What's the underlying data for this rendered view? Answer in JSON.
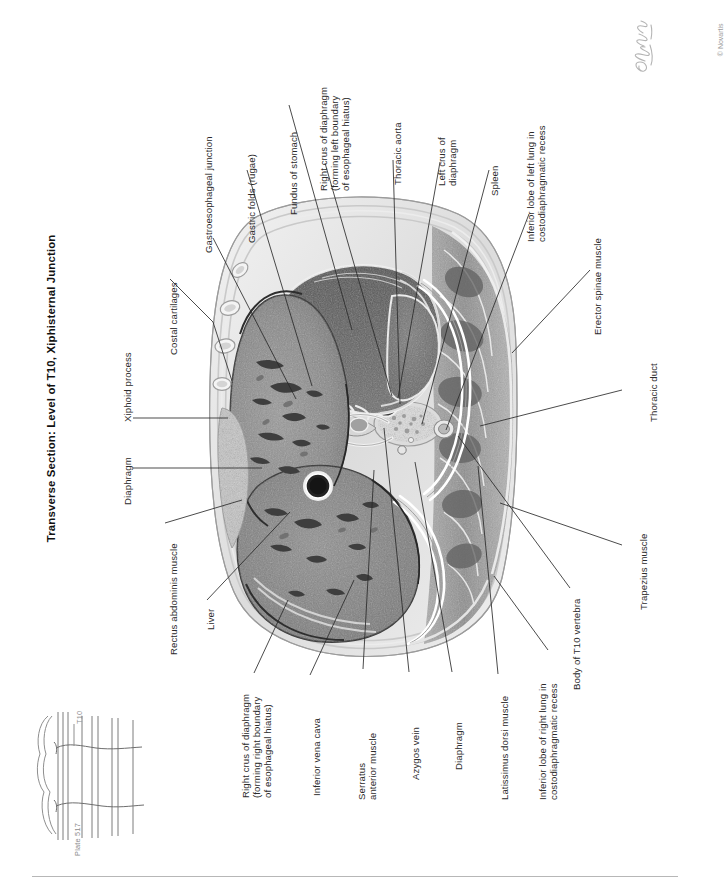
{
  "page": {
    "title": "Transverse Section: Level of T10, Xiphisternal Junction",
    "plate_number": "Plate 517",
    "vertebral_level": "T10",
    "copyright": "© Novartis",
    "signature": "C. Machado"
  },
  "labels": {
    "top": [
      {
        "id": "gastroesophageal-junction",
        "text": "Gastroesophageal junction"
      },
      {
        "id": "gastric-folds",
        "text": "Gastric folds (rugae)"
      },
      {
        "id": "fundus-of-stomach",
        "text": "Fundus of stomach"
      },
      {
        "id": "right-crus-left-boundary",
        "text": "Right crus of diaphragm\n(forming left boundary\nof esophageal hiatus)"
      },
      {
        "id": "thoracic-aorta",
        "text": "Thoracic aorta"
      },
      {
        "id": "left-crus-of-diaphragm",
        "text": "Left crus of\ndiaphragm"
      },
      {
        "id": "spleen",
        "text": "Spleen"
      },
      {
        "id": "inferior-lobe-left-lung",
        "text": "Inferior lobe of left lung in\ncostodiaphragmatic recess"
      },
      {
        "id": "erector-spinae-muscle",
        "text": "Erector spinae muscle"
      }
    ],
    "left": [
      {
        "id": "costal-cartilages",
        "text": "Costal cartilages"
      },
      {
        "id": "xiphoid-process",
        "text": "Xiphoid process"
      },
      {
        "id": "diaphragm-left",
        "text": "Diaphragm"
      },
      {
        "id": "rectus-abdominis-muscle",
        "text": "Rectus abdominis muscle"
      },
      {
        "id": "liver",
        "text": "Liver"
      }
    ],
    "bottom": [
      {
        "id": "right-crus-right-boundary",
        "text": "Right crus of diaphragm\n(forming right boundary\nof esophageal hiatus)"
      },
      {
        "id": "inferior-vena-cava",
        "text": "Inferior vena cava"
      },
      {
        "id": "serratus-anterior-muscle",
        "text": "Serratus\nanterior muscle"
      },
      {
        "id": "azygos-vein",
        "text": "Azygos vein"
      },
      {
        "id": "diaphragm-bottom",
        "text": "Diaphragm"
      },
      {
        "id": "latissimus-dorsi-muscle",
        "text": "Latissimus dorsi muscle"
      },
      {
        "id": "inferior-lobe-right-lung",
        "text": "Inferior lobe of right lung in\ncostodiaphragmatic recess"
      },
      {
        "id": "body-of-t10-vertebra",
        "text": "Body of T10 vertebra"
      }
    ],
    "right": [
      {
        "id": "trapezius-muscle",
        "text": "Trapezius muscle"
      },
      {
        "id": "thoracic-duct",
        "text": "Thoracic duct"
      }
    ]
  },
  "colors": {
    "ink": "#2b2b2b",
    "leader": "#2a2a2a",
    "key_gray": "#8c8c8c",
    "rule": "#b7b7b7",
    "tissue_mid": "#8b8b8b",
    "tissue_dark": "#5e5e5e",
    "tissue_light": "#d8d8d8",
    "cavity": "#4a4a4a"
  }
}
